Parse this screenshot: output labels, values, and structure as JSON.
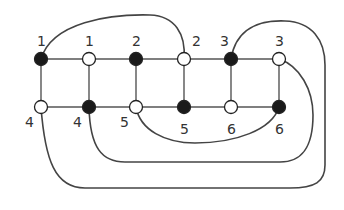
{
  "title": "",
  "colors": {
    "background": "#ffffff",
    "line": "#555555",
    "black_node": "#1a1a1a",
    "white_node": "#ffffff",
    "label": "#333333"
  },
  "nodes": [
    {
      "id": "t1",
      "label": "1",
      "color": "black",
      "x": 41,
      "y": 59,
      "label_x": 37,
      "label_y": 46
    },
    {
      "id": "t2",
      "label": "1",
      "color": "white",
      "x": 89,
      "y": 59,
      "label_x": 85,
      "label_y": 46
    },
    {
      "id": "t3",
      "label": "2",
      "color": "black",
      "x": 136,
      "y": 59,
      "label_x": 132,
      "label_y": 46
    },
    {
      "id": "t4",
      "label": "2",
      "color": "white",
      "x": 184,
      "y": 59,
      "label_x": 192,
      "label_y": 46
    },
    {
      "id": "t5",
      "label": "3",
      "color": "black",
      "x": 231,
      "y": 59,
      "label_x": 220,
      "label_y": 46
    },
    {
      "id": "t6",
      "label": "3",
      "color": "white",
      "x": 279,
      "y": 59,
      "label_x": 275,
      "label_y": 46
    },
    {
      "id": "b1",
      "label": "4",
      "color": "white",
      "x": 41,
      "y": 107,
      "label_x": 25,
      "label_y": 127
    },
    {
      "id": "b2",
      "label": "4",
      "color": "black",
      "x": 89,
      "y": 107,
      "label_x": 73,
      "label_y": 127
    },
    {
      "id": "b3",
      "label": "5",
      "color": "white",
      "x": 136,
      "y": 107,
      "label_x": 120,
      "label_y": 127
    },
    {
      "id": "b4",
      "label": "5",
      "color": "black",
      "x": 184,
      "y": 107,
      "label_x": 180,
      "label_y": 134
    },
    {
      "id": "b5",
      "label": "6",
      "color": "white",
      "x": 231,
      "y": 107,
      "label_x": 227,
      "label_y": 134
    },
    {
      "id": "b6",
      "label": "6",
      "color": "black",
      "x": 279,
      "y": 107,
      "label_x": 275,
      "label_y": 134
    }
  ],
  "edges": [
    [
      "t1",
      "t2"
    ],
    [
      "t2",
      "t3"
    ],
    [
      "t3",
      "t4"
    ],
    [
      "t4",
      "t5"
    ],
    [
      "t5",
      "t6"
    ],
    [
      "b1",
      "b2"
    ],
    [
      "b2",
      "b3"
    ],
    [
      "b3",
      "b4"
    ],
    [
      "b4",
      "b5"
    ],
    [
      "b5",
      "b6"
    ],
    [
      "t1",
      "b1"
    ],
    [
      "t2",
      "b2"
    ],
    [
      "t3",
      "b3"
    ],
    [
      "t4",
      "b4"
    ],
    [
      "t5",
      "b5"
    ],
    [
      "t6",
      "b6"
    ]
  ],
  "curves": [
    {
      "name": "arc-1-black-to-2-white",
      "from": "t1",
      "to": "t4",
      "d": "M41,59 C52,22 110,14 150,15 C175,16 186,34 184,59"
    },
    {
      "name": "arc-3-black-to-4-white",
      "from": "t5",
      "to": "b1",
      "d": "M231,59 C236,28 260,20 285,21 C312,22 325,40 325,65 L325,165 C325,182 315,188 290,188 L85,188 C55,188 45,160 41,107"
    },
    {
      "name": "arc-3-white-to-4-black",
      "from": "t6",
      "to": "b2",
      "d": "M279,59 C300,66 313,90 313,115 C313,150 300,162 280,162 L125,162 C102,162 90,148 89,107"
    },
    {
      "name": "arc-5-white-to-6-black",
      "from": "b3",
      "to": "b6",
      "d": "M136,107 C140,130 165,143 195,143 C235,143 272,130 279,107"
    }
  ]
}
